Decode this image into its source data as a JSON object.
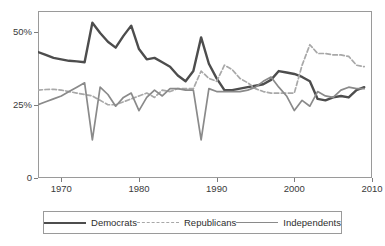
{
  "chart_data": {
    "type": "line",
    "title": "",
    "xlabel": "",
    "ylabel": "",
    "xlim": [
      1967,
      2010
    ],
    "ylim": [
      0,
      57
    ],
    "grid": false,
    "legend_position": "bottom",
    "y_ticks": [
      0,
      25,
      50
    ],
    "y_tick_labels": [
      "0",
      "25%",
      "50%"
    ],
    "x_ticks": [
      1970,
      1980,
      1990,
      2000,
      2010
    ],
    "x_tick_labels": [
      "1970",
      "1980",
      "1990",
      "2000",
      "2010"
    ],
    "x": [
      1967,
      1968,
      1969,
      1970,
      1971,
      1972,
      1973,
      1974,
      1975,
      1976,
      1977,
      1978,
      1979,
      1980,
      1981,
      1982,
      1983,
      1984,
      1985,
      1986,
      1987,
      1988,
      1989,
      1990,
      1991,
      1992,
      1993,
      1994,
      1995,
      1996,
      1997,
      1998,
      1999,
      2000,
      2001,
      2002,
      2003,
      2004,
      2005,
      2006,
      2007,
      2008,
      2009
    ],
    "series": [
      {
        "name": "Democrats",
        "color": "#4d4d4d",
        "style": "solid",
        "width": 2.4,
        "values": [
          43.0,
          42.0,
          41.0,
          40.5,
          40.0,
          39.8,
          39.5,
          53.0,
          49.5,
          46.5,
          44.5,
          48.5,
          52.0,
          44.0,
          40.5,
          41.0,
          39.5,
          38.0,
          35.0,
          33.0,
          36.5,
          48.0,
          39.0,
          34.0,
          30.0,
          30.0,
          30.5,
          31.0,
          31.5,
          32.0,
          33.5,
          36.5,
          36.0,
          35.5,
          34.5,
          33.0,
          27.0,
          26.5,
          27.5,
          28.0,
          27.5,
          30.0,
          31.0
        ]
      },
      {
        "name": "Republicans",
        "color": "#a8a8a8",
        "style": "dashed",
        "width": 1.7,
        "values": [
          30.0,
          30.2,
          30.3,
          30.0,
          29.5,
          29.0,
          28.5,
          28.0,
          26.5,
          25.0,
          25.0,
          26.0,
          27.0,
          28.0,
          29.0,
          27.5,
          30.0,
          29.5,
          30.5,
          30.5,
          30.5,
          36.5,
          34.0,
          33.0,
          38.5,
          37.0,
          34.0,
          32.5,
          30.5,
          29.5,
          29.0,
          29.0,
          29.0,
          29.0,
          38.5,
          45.5,
          42.5,
          42.5,
          42.0,
          42.0,
          41.5,
          38.5,
          38.0
        ]
      },
      {
        "name": "Independents",
        "color": "#8a8a8a",
        "style": "solid",
        "width": 1.7,
        "values": [
          25.0,
          26.0,
          27.0,
          28.0,
          29.5,
          31.0,
          32.5,
          13.0,
          31.0,
          28.5,
          24.5,
          27.5,
          29.0,
          23.0,
          27.5,
          30.0,
          28.0,
          30.5,
          30.5,
          30.0,
          30.0,
          13.0,
          30.5,
          29.5,
          29.5,
          29.5,
          29.5,
          30.0,
          31.0,
          33.0,
          34.5,
          31.0,
          28.0,
          23.0,
          26.5,
          24.5,
          29.5,
          28.0,
          27.5,
          30.0,
          31.0,
          30.5,
          30.5
        ]
      }
    ]
  },
  "legend": {
    "items": [
      {
        "label": "Democrats"
      },
      {
        "label": "Republicans"
      },
      {
        "label": "Independents"
      }
    ]
  }
}
